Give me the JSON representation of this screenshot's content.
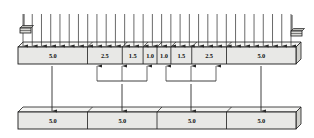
{
  "diagram": {
    "colors": {
      "bar_face": "#e8e8e6",
      "bar_top": "#f4f4f2",
      "bar_side": "#cfcfcb",
      "outline": "#1a1a1a",
      "arrow": "#2a2a2a",
      "text": "#111111",
      "background": "#ffffff"
    },
    "top_beam": {
      "name": "upper-beam",
      "x": 18,
      "y": 47,
      "width": 278,
      "height": 17,
      "depth": 5,
      "segments": [
        {
          "label": "5.0",
          "width_units": 5.0
        },
        {
          "label": "2.5",
          "width_units": 2.5
        },
        {
          "label": "1.5",
          "width_units": 1.5
        },
        {
          "label": "1.0",
          "width_units": 1.0
        },
        {
          "label": "1.0",
          "width_units": 1.0
        },
        {
          "label": "1.5",
          "width_units": 1.5
        },
        {
          "label": "2.5",
          "width_units": 2.5
        },
        {
          "label": "5.0",
          "width_units": 5.0
        }
      ]
    },
    "bottom_beam": {
      "name": "lower-beam",
      "x": 18,
      "y": 112,
      "width": 278,
      "height": 17,
      "depth": 5,
      "segments": [
        {
          "label": "5.0",
          "width_units": 5.0
        },
        {
          "label": "5.0",
          "width_units": 5.0
        },
        {
          "label": "5.0",
          "width_units": 5.0
        },
        {
          "label": "5.0",
          "width_units": 5.0
        }
      ]
    },
    "distributed_load": {
      "name": "distributed-load-arrows",
      "count": 30,
      "x_start": 23,
      "x_end": 291,
      "y_top": 14,
      "y_bottom": 46
    },
    "supports": [
      {
        "name": "left-support",
        "x": 20,
        "y": 28
      },
      {
        "name": "right-support",
        "x": 291,
        "y": 31
      }
    ],
    "support_arrows": [
      {
        "name": "left-support-arrow",
        "x": 24,
        "y_top": 14,
        "y_bottom": 28
      },
      {
        "name": "right-support-arrow",
        "x": 292,
        "y_top": 15,
        "y_bottom": 31
      }
    ],
    "transfer_arrows": [
      {
        "name": "transfer-arrow-segment-1",
        "x": 52,
        "y_top": 66,
        "y_bottom": 111
      },
      {
        "name": "transfer-arrow-segment-2",
        "x": 122,
        "y_top": 84,
        "y_bottom": 111
      },
      {
        "name": "transfer-arrow-segment-3",
        "x": 191,
        "y_top": 84,
        "y_bottom": 111
      },
      {
        "name": "transfer-arrow-segment-4",
        "x": 261,
        "y_top": 66,
        "y_bottom": 111
      }
    ],
    "brackets": [
      {
        "name": "left-bracket",
        "x_left": 97,
        "x_right": 147,
        "y_bar": 81,
        "stem_x": 122,
        "tick_xs": [
          97,
          122,
          147
        ],
        "tick_y_top": 66
      },
      {
        "name": "right-bracket",
        "x_left": 166,
        "x_right": 216,
        "y_bar": 81,
        "stem_x": 191,
        "tick_xs": [
          166,
          191,
          216
        ],
        "tick_y_top": 66
      }
    ]
  }
}
